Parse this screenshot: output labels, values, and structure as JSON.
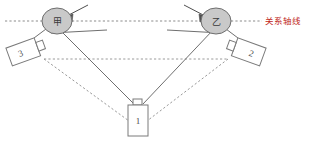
{
  "diagram": {
    "axis": {
      "label": "关系轴线",
      "label_color": "#c0271a",
      "line_color": "#8b8b8b",
      "style": "dotted"
    },
    "persons": [
      {
        "id": "person-jia",
        "label": "甲",
        "fill": "#c9c9c9",
        "stroke": "#6e6e6e"
      },
      {
        "id": "person-yi",
        "label": "乙",
        "fill": "#c9c9c9",
        "stroke": "#6e6e6e"
      }
    ],
    "cameras": [
      {
        "id": "camera-1",
        "label": "1",
        "position": "bottom-center"
      },
      {
        "id": "camera-2",
        "label": "2",
        "position": "right"
      },
      {
        "id": "camera-3",
        "label": "3",
        "position": "left"
      }
    ],
    "colors": {
      "sight_line": "#6f6f6f",
      "triangle_dotted": "#9a9a9a",
      "camera_stroke": "#7a7a7a",
      "camera_fill": "#ffffff"
    }
  }
}
